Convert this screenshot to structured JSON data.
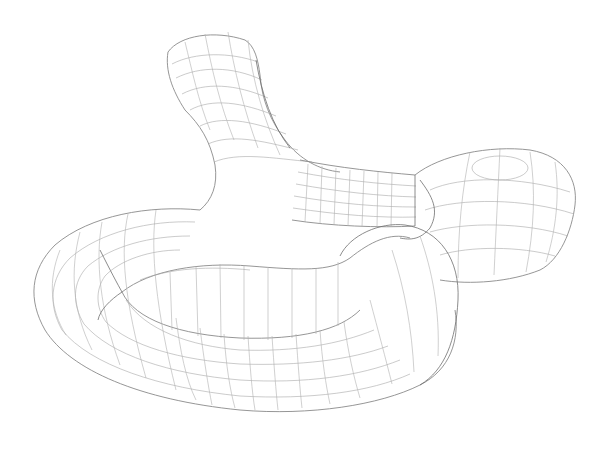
{
  "figure": {
    "type": "wireframe-mesh",
    "background_color": "#ffffff",
    "line_color": "#a8a8a8",
    "outline_color": "#8a8a8a",
    "parts": [
      {
        "name": "upper-branch",
        "description": "flared tube rising upward at top-center"
      },
      {
        "name": "straight-connector",
        "description": "short straight tubular section in the middle"
      },
      {
        "name": "end-cap",
        "description": "bulbous rounded end at right with flat circular top"
      },
      {
        "name": "curved-loop",
        "description": "large C-shaped torus-like tube forming the front/left/bottom"
      }
    ]
  }
}
